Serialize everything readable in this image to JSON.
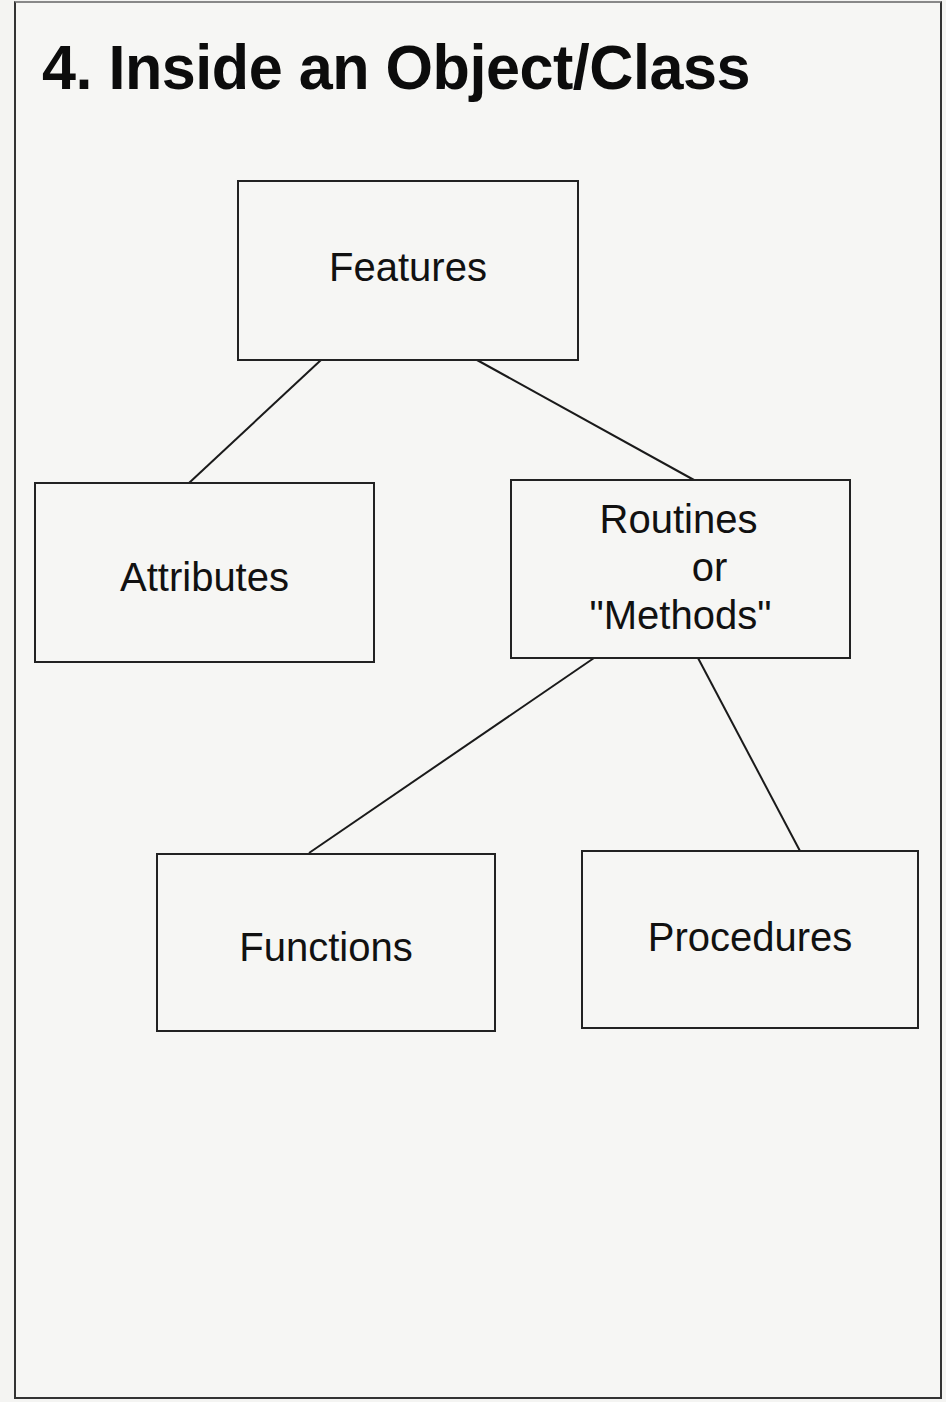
{
  "slide": {
    "title": "4.  Inside an Object/Class"
  },
  "diagram": {
    "nodes": {
      "features": {
        "label": "Features"
      },
      "attributes": {
        "label": "Attributes"
      },
      "routines": {
        "lines": [
          "Routines",
          "or",
          "\"Methods\""
        ]
      },
      "functions": {
        "label": "Functions"
      },
      "procedures": {
        "label": "Procedures"
      }
    },
    "edges": [
      {
        "from": "Features",
        "to": "Attributes"
      },
      {
        "from": "Features",
        "to": "Routines or \"Methods\""
      },
      {
        "from": "Routines or \"Methods\"",
        "to": "Functions"
      },
      {
        "from": "Routines or \"Methods\"",
        "to": "Procedures"
      }
    ],
    "colors": {
      "background": "#f6f6f4",
      "stroke": "#222222",
      "text": "#111111"
    }
  }
}
